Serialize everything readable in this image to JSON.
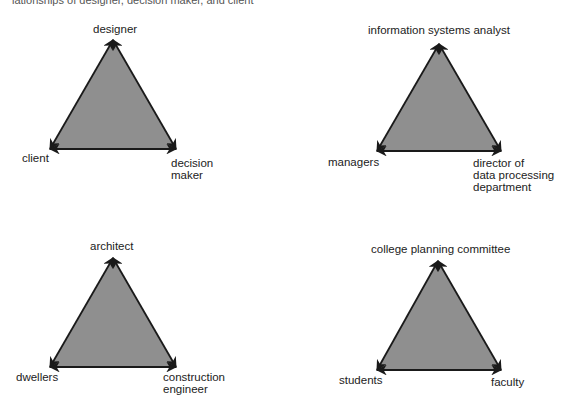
{
  "caption": "lationships of designer, decision maker, and client",
  "colors": {
    "fill": "#8f8f8f",
    "stroke": "#1a1a1a",
    "text": "#222222"
  },
  "triangles": [
    {
      "id": "designer-triangle",
      "apex": {
        "label": "designer",
        "x": 113,
        "y": 40
      },
      "left": {
        "label": "client",
        "x": 50,
        "y": 149
      },
      "right": {
        "label": "decision maker",
        "lines": [
          "decision",
          "maker"
        ],
        "x": 176,
        "y": 149
      }
    },
    {
      "id": "information-systems-triangle",
      "apex": {
        "label": "information systems analyst",
        "x": 439,
        "y": 44
      },
      "left": {
        "label": "managers",
        "x": 377,
        "y": 151
      },
      "right": {
        "label": "director of data processing department",
        "lines": [
          "director of",
          "data processing",
          "department"
        ],
        "x": 501,
        "y": 151
      }
    },
    {
      "id": "architect-triangle",
      "apex": {
        "label": "architect",
        "x": 113,
        "y": 258
      },
      "left": {
        "label": "dwellers",
        "x": 50,
        "y": 367
      },
      "right": {
        "label": "construction engineer",
        "lines": [
          "construction",
          "engineer"
        ],
        "x": 176,
        "y": 367
      }
    },
    {
      "id": "college-planning-triangle",
      "apex": {
        "label": "college planning committee",
        "x": 438,
        "y": 261
      },
      "left": {
        "label": "students",
        "x": 377,
        "y": 370
      },
      "right": {
        "label": "faculty",
        "x": 501,
        "y": 370
      }
    }
  ]
}
